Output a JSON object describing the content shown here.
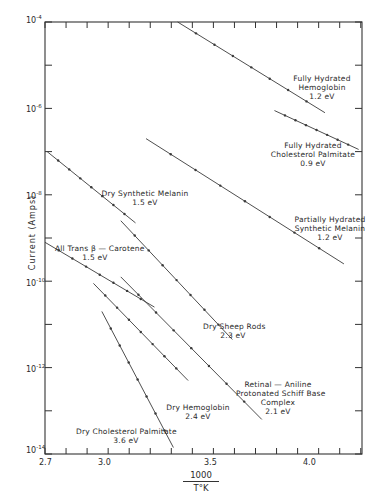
{
  "chart_data": {
    "type": "line",
    "title": "",
    "xlabel": "1000 / T°K",
    "xlabel_numerator": "1000",
    "xlabel_denominator": "T°K",
    "ylabel": "Current (Amps)",
    "yscale": "log",
    "xlim": [
      2.7,
      4.25
    ],
    "ylim_exponent": [
      -14,
      -4
    ],
    "x_ticks": [
      2.7,
      3.0,
      3.5,
      4.0
    ],
    "x_tick_labels": [
      "2.7",
      "3.0",
      "3.5",
      "4.0"
    ],
    "y_ticks": [
      -4,
      -6,
      -8,
      -10,
      -12,
      -14
    ],
    "y_tick_labels": [
      "10-4",
      "10-6",
      "10-8",
      "10-10",
      "10-12",
      "10-14"
    ],
    "grid": false,
    "legend": "none (inline labels)",
    "series": [
      {
        "name": "Fully Hydrated Hemoglobin",
        "activation_energy": "1.2 eV",
        "x": [
          3.33,
          4.03
        ],
        "log10_current": [
          -4.0,
          -6.1
        ]
      },
      {
        "name": "Fully Hydrated Cholesterol Palmitate",
        "activation_energy": "0.9 eV",
        "x": [
          3.79,
          4.19
        ],
        "log10_current": [
          -6.05,
          -6.95
        ]
      },
      {
        "name": "Partially Hydrated Synthetic Melanin",
        "activation_energy": "1.2 eV",
        "x": [
          3.18,
          4.12
        ],
        "log10_current": [
          -6.7,
          -9.6
        ]
      },
      {
        "name": "Dry Synthetic Melanin",
        "activation_energy": "1.5 eV",
        "x": [
          2.71,
          3.13
        ],
        "log10_current": [
          -7.0,
          -8.65
        ]
      },
      {
        "name": "All Trans β-Carotene",
        "activation_energy": "1.5 eV",
        "x": [
          2.7,
          3.22
        ],
        "log10_current": [
          -9.1,
          -10.6
        ]
      },
      {
        "name": "Dry Sheep Rods",
        "activation_energy": "2.3 eV",
        "x": [
          3.06,
          3.59
        ],
        "log10_current": [
          -8.6,
          -11.35
        ]
      },
      {
        "name": "Retinal—Aniline Protonated Schiff Base Complex",
        "activation_energy": "2.1 eV",
        "x": [
          3.06,
          3.73
        ],
        "log10_current": [
          -9.9,
          -13.2
        ]
      },
      {
        "name": "Dry Hemoglobin",
        "activation_energy": "2.4 eV",
        "x": [
          2.93,
          3.38
        ],
        "log10_current": [
          -10.05,
          -12.3
        ]
      },
      {
        "name": "Dry Cholesterol Palmitate",
        "activation_energy": "3.6 eV",
        "x": [
          2.97,
          3.31
        ],
        "log10_current": [
          -10.7,
          -13.85
        ]
      }
    ]
  },
  "labels": {
    "fh_hemoglobin": [
      "Fully Hydrated",
      "Hemoglobin",
      "1.2 eV"
    ],
    "fh_cholesterol": [
      "Fully Hydrated",
      "Cholesterol Palmitate",
      "0.9 eV"
    ],
    "ph_melanin": [
      "Partially Hydrated",
      "Synthetic Melanin",
      "1.2 eV"
    ],
    "dry_melanin": [
      "Dry Synthetic Melanin",
      "1.5 eV"
    ],
    "carotene": [
      "All Trans β — Carotene",
      "1.5 eV"
    ],
    "sheep_rods": [
      "Dry Sheep Rods",
      "2.3 eV"
    ],
    "retinal": [
      "Retinal — Aniline",
      "Protonated Schiff Base",
      "Complex",
      "2.1 eV"
    ],
    "dry_hemoglobin": [
      "Dry Hemoglobin",
      "2.4 eV"
    ],
    "dry_cholesterol": [
      "Dry Cholesterol Palmitate",
      "3.6 eV"
    ]
  },
  "axis": {
    "y_title": "Current  (Amps)",
    "y_tick_base": "10",
    "y_tick_exps": [
      "-4",
      "-6",
      "-8",
      "-10",
      "-12",
      "-14"
    ],
    "x_tick_labels": [
      "2.7",
      "3.0",
      "3.5",
      "4.0"
    ],
    "x_title_num": "1000",
    "x_title_den": "T°K"
  },
  "colors": {
    "line": "#3a3a3a",
    "frame": "#333333",
    "background": "#ffffff"
  }
}
